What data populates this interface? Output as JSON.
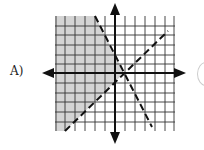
{
  "option": {
    "label": "A)"
  },
  "graph": {
    "description": "System of two linear inequalities with dashed boundary lines; shaded region left of both lines",
    "grid_color": "#333333",
    "shade_color": "#d4d4d4",
    "axis_color": "#111111",
    "boundary_lines": [
      {
        "name": "steep-negative-line",
        "style": "dashed",
        "from": [
          95,
          16
        ],
        "to": [
          152,
          127
        ]
      },
      {
        "name": "positive-slope-line",
        "style": "dashed",
        "from": [
          65,
          131
        ],
        "to": [
          168,
          31
        ]
      }
    ]
  }
}
